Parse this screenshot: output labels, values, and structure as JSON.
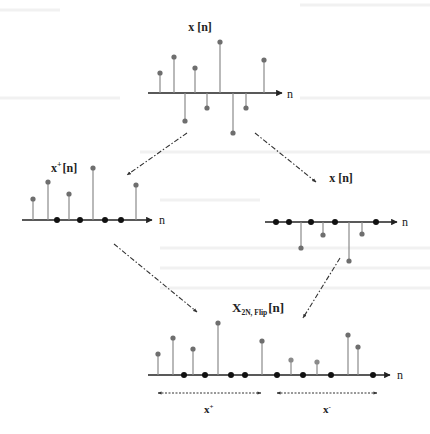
{
  "diagram": {
    "top": {
      "title": "x [n]",
      "axis_label": "n",
      "axis": {
        "x1": 148,
        "x2": 282,
        "y": 93
      },
      "stems": [
        {
          "x": 160,
          "y": 73,
          "color": "#6e6e6e"
        },
        {
          "x": 174,
          "y": 57,
          "color": "#6e6e6e"
        },
        {
          "x": 185,
          "y": 121,
          "color": "#6e6e6e"
        },
        {
          "x": 195,
          "y": 68,
          "color": "#6e6e6e"
        },
        {
          "x": 207,
          "y": 108,
          "color": "#6e6e6e"
        },
        {
          "x": 220,
          "y": 42,
          "color": "#6e6e6e"
        },
        {
          "x": 233,
          "y": 133,
          "color": "#6e6e6e"
        },
        {
          "x": 246,
          "y": 108,
          "color": "#6e6e6e"
        },
        {
          "x": 264,
          "y": 60,
          "color": "#6e6e6e"
        }
      ],
      "zeros": []
    },
    "left": {
      "title": "x",
      "title_sup": "+",
      "title_tail": "[n]",
      "axis_label": "n",
      "axis": {
        "x1": 22,
        "x2": 152,
        "y": 220
      },
      "stems": [
        {
          "x": 33,
          "y": 199,
          "color": "#6e6e6e"
        },
        {
          "x": 48,
          "y": 182,
          "color": "#6e6e6e"
        },
        {
          "x": 69,
          "y": 194,
          "color": "#6e6e6e"
        },
        {
          "x": 93,
          "y": 168,
          "color": "#6e6e6e"
        },
        {
          "x": 136,
          "y": 185,
          "color": "#6e6e6e"
        }
      ],
      "zeros": [
        57,
        80,
        105,
        121
      ]
    },
    "right": {
      "title": "x [n]",
      "axis_label": "n",
      "axis": {
        "x1": 265,
        "x2": 397,
        "y": 222
      },
      "stems": [
        {
          "x": 301,
          "y": 248,
          "color": "#6e6e6e"
        },
        {
          "x": 323,
          "y": 235,
          "color": "#6e6e6e"
        },
        {
          "x": 349,
          "y": 261,
          "color": "#6e6e6e"
        },
        {
          "x": 362,
          "y": 234,
          "color": "#6e6e6e"
        }
      ],
      "zeros": [
        276,
        289,
        311,
        335,
        376
      ]
    },
    "bottom": {
      "title": "X",
      "title_sub": "2N, Flip",
      "title_tail": "[n]",
      "axis_label": "n",
      "axis": {
        "x1": 148,
        "x2": 390,
        "y": 375
      },
      "stems": [
        {
          "x": 158,
          "y": 354,
          "color": "#6e6e6e"
        },
        {
          "x": 173,
          "y": 338,
          "color": "#6e6e6e"
        },
        {
          "x": 193,
          "y": 349,
          "color": "#6e6e6e"
        },
        {
          "x": 218,
          "y": 323,
          "color": "#6e6e6e"
        },
        {
          "x": 262,
          "y": 341,
          "color": "#6e6e6e"
        },
        {
          "x": 291,
          "y": 360,
          "color": "#8a8a8a"
        },
        {
          "x": 317,
          "y": 362,
          "color": "#8a8a8a"
        },
        {
          "x": 348,
          "y": 335,
          "color": "#6e6e6e"
        },
        {
          "x": 358,
          "y": 347,
          "color": "#6e6e6e"
        }
      ],
      "zeros": [
        184,
        205,
        231,
        245,
        277,
        303,
        331,
        373
      ],
      "ranges": [
        {
          "label": "x",
          "sup": "+",
          "x1": 157,
          "x2": 262,
          "y": 393,
          "label_x": 208,
          "label_y": 411
        },
        {
          "label": "x",
          "sup": "-",
          "x1": 276,
          "x2": 378,
          "y": 393,
          "label_x": 327,
          "label_y": 411
        }
      ]
    },
    "arrows": [
      {
        "from": [
          187,
          133
        ],
        "to": [
          127,
          175
        ]
      },
      {
        "from": [
          255,
          133
        ],
        "to": [
          316,
          182
        ]
      },
      {
        "from": [
          114,
          244
        ],
        "to": [
          197,
          312
        ]
      },
      {
        "from": [
          340,
          258
        ],
        "to": [
          303,
          318
        ]
      }
    ],
    "colors": {
      "axis": "#222222",
      "stem": "#6e6e6e",
      "zero_dot": "#111111",
      "arrow": "#333333"
    }
  }
}
